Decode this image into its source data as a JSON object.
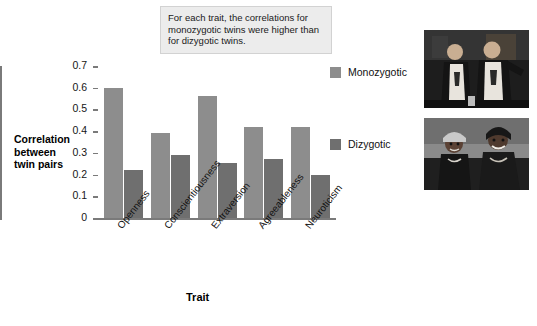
{
  "caption": {
    "text": "For each trait, the correlations for monozygotic twins were higher than for dizygotic twins."
  },
  "legend": {
    "position": "right",
    "items": [
      {
        "label": "Monozygotic",
        "color": "#8d8d8d"
      },
      {
        "label": "Dizygotic",
        "color": "#6f6f6f"
      }
    ]
  },
  "axes": {
    "y_title_lines": [
      "Correlation",
      "between",
      "twin pairs"
    ],
    "x_title": "Trait",
    "y_ticks": [
      "0.7",
      "0.6",
      "0.5",
      "0.4",
      "0.3",
      "0.2",
      "0.1",
      "0"
    ]
  },
  "photos": [
    {
      "name": "monozygotic-twins-photo",
      "alt": "Two identical twin men in white t-shirts and dark jackets"
    },
    {
      "name": "dizygotic-twins-photo",
      "alt": "Two fraternal twin women smiling outdoors"
    }
  ],
  "chart_data": {
    "type": "bar",
    "title": "",
    "subtitle": "",
    "xlabel": "Trait",
    "ylabel": "Correlation between twin pairs",
    "categories": [
      "Openness",
      "Conscientiousness",
      "Extraversion",
      "Agreeableness",
      "Neuroticism"
    ],
    "series": [
      {
        "name": "Monozygotic",
        "color": "#8d8d8d",
        "values": [
          0.6,
          0.39,
          0.56,
          0.42,
          0.42
        ]
      },
      {
        "name": "Dizygotic",
        "color": "#6f6f6f",
        "values": [
          0.22,
          0.29,
          0.255,
          0.27,
          0.2
        ]
      }
    ],
    "ylim": [
      0,
      0.7
    ],
    "ytick_step": 0.1,
    "grid": false,
    "legend_position": "right",
    "annotations": [
      "For each trait, the correlations for monozygotic twins were higher than for dizygotic twins."
    ]
  }
}
